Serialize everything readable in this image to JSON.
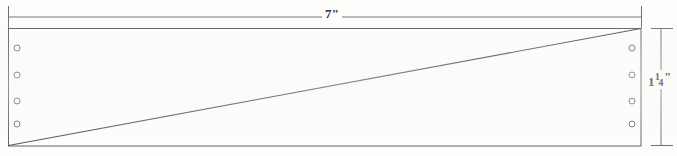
{
  "drawing": {
    "kind": "engineering-plate-drawing",
    "background_color": "#fdfdfc",
    "line_color": "#5a5a5a",
    "text_color": "#2b2b2b",
    "plate": {
      "x": 8,
      "y": 28,
      "width": 633,
      "height": 118,
      "stroke_width": 1
    },
    "diagonal": {
      "description": "diagonal line from bottom-left corner to top-right corner",
      "x1": 8,
      "y1": 146,
      "x2": 641,
      "y2": 28
    },
    "holes": {
      "radius": 3,
      "left_column_x": 17,
      "right_column_x": 632,
      "rows_y": [
        48,
        75,
        101,
        124
      ],
      "count_per_column": 4,
      "total": 8
    },
    "width_dimension": {
      "label": "7\"",
      "value": "7",
      "unit": "\"",
      "line_y": 17,
      "x_start": 8,
      "x_end": 641,
      "tick_half_height": 11
    },
    "height_dimension": {
      "label": "1 1/4\"",
      "whole": "1",
      "numerator": "1",
      "denominator": "4",
      "unit": "\"",
      "line_x": 661,
      "y_start": 28,
      "y_end": 146,
      "tick_half_width": 10
    }
  }
}
